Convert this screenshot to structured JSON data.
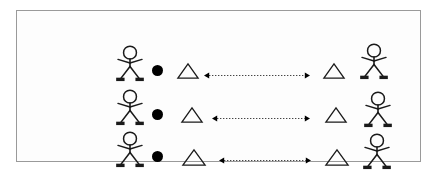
{
  "diagram": {
    "frame": {
      "x": 16,
      "y": 10,
      "width": 405,
      "height": 152,
      "border_color": "#9a9a9a",
      "background": "#fdfdfd"
    },
    "page_background": "#ffffff",
    "stroke_color": "#1a1a1a",
    "fill_color": "#000000",
    "rows": [
      {
        "id": "row-1",
        "label": "row-1",
        "left_figure": {
          "x": 82,
          "y": 24,
          "w": 30,
          "h": 36,
          "facing": "front"
        },
        "left_dot": {
          "x": 119,
          "y": 44,
          "d": 11
        },
        "left_triangle": {
          "x": 144,
          "y": 42,
          "w": 22,
          "h": 16
        },
        "arrow": {
          "x1": 171,
          "x2": 277,
          "y": 54,
          "direction": "both",
          "style": "dotted"
        },
        "right_triangle": {
          "x": 290,
          "y": 42,
          "w": 22,
          "h": 16
        },
        "right_figure": {
          "x": 326,
          "y": 22,
          "w": 30,
          "h": 36,
          "facing": "front"
        }
      },
      {
        "id": "row-2",
        "label": "row-2",
        "left_figure": {
          "x": 82,
          "y": 68,
          "w": 30,
          "h": 36,
          "facing": "front"
        },
        "left_dot": {
          "x": 119,
          "y": 88,
          "d": 11
        },
        "left_triangle": {
          "x": 148,
          "y": 86,
          "w": 22,
          "h": 16
        },
        "arrow": {
          "x1": 179,
          "x2": 277,
          "y": 97,
          "direction": "both",
          "style": "dotted"
        },
        "right_triangle": {
          "x": 292,
          "y": 86,
          "w": 22,
          "h": 16
        },
        "right_figure": {
          "x": 330,
          "y": 70,
          "w": 30,
          "h": 36,
          "facing": "front"
        }
      },
      {
        "id": "row-3",
        "label": "row-3",
        "left_figure": {
          "x": 82,
          "y": 110,
          "w": 30,
          "h": 36,
          "facing": "front"
        },
        "left_dot": {
          "x": 119,
          "y": 130,
          "d": 11
        },
        "left_triangle": {
          "x": 149,
          "y": 128,
          "w": 24,
          "h": 17
        },
        "arrow": {
          "x1": 186,
          "x2": 278,
          "y": 139,
          "direction": "both",
          "style": "dotted"
        },
        "right_triangle": {
          "x": 292,
          "y": 128,
          "w": 24,
          "h": 17
        },
        "right_figure": {
          "x": 329,
          "y": 112,
          "w": 30,
          "h": 36,
          "facing": "front"
        }
      }
    ]
  }
}
